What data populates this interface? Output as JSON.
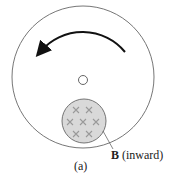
{
  "figure": {
    "label_field_name": "B",
    "label_field_direction": "(inward)",
    "caption": "(a)",
    "rotation": "counterclockwise",
    "field_marks": [
      "x",
      "x",
      "x",
      "x",
      "x",
      "x",
      "x"
    ]
  }
}
